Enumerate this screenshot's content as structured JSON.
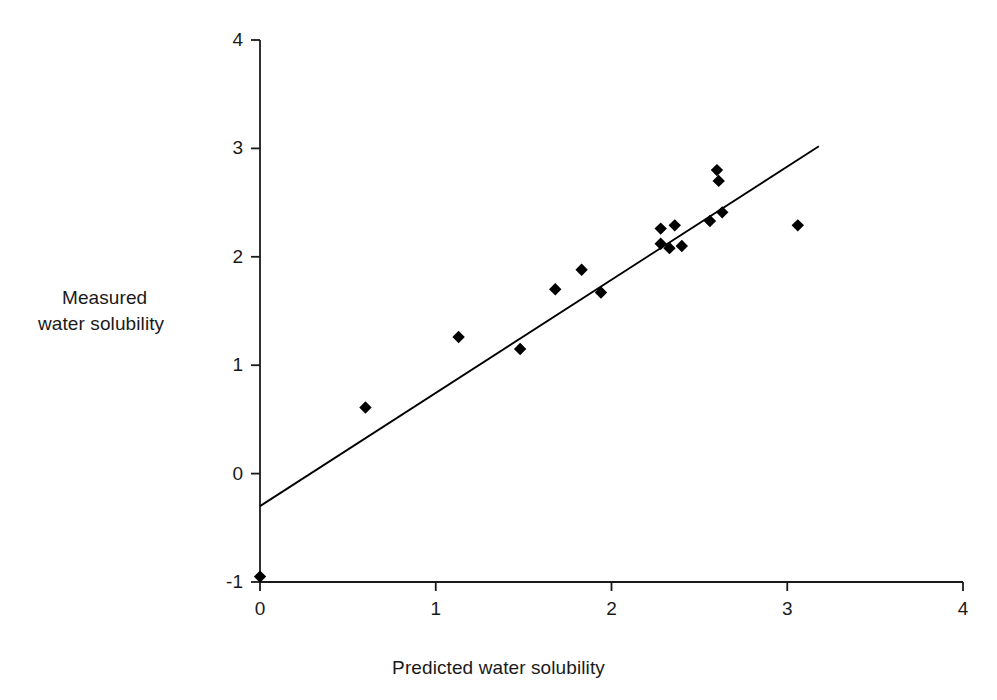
{
  "chart_data": {
    "type": "scatter",
    "title": "",
    "xlabel": "Predicted water solubility",
    "ylabel": "Measured\nwater solubility",
    "ylabel_lines": [
      "Measured",
      "water solubility"
    ],
    "xlim": [
      0,
      4
    ],
    "ylim": [
      -1,
      4
    ],
    "xticks": [
      0,
      1,
      2,
      3,
      4
    ],
    "yticks": [
      -1,
      0,
      1,
      2,
      3,
      4
    ],
    "xticklabels": [
      "0",
      "1",
      "2",
      "3",
      "4"
    ],
    "yticklabels": [
      "-1",
      "0",
      "1",
      "2",
      "3",
      "4"
    ],
    "grid": false,
    "legend": null,
    "marker": "diamond",
    "marker_color": "#000000",
    "line_color": "#000000",
    "points": [
      {
        "x": 0.0,
        "y": -0.95
      },
      {
        "x": 0.6,
        "y": 0.61
      },
      {
        "x": 1.13,
        "y": 1.26
      },
      {
        "x": 1.48,
        "y": 1.15
      },
      {
        "x": 1.68,
        "y": 1.7
      },
      {
        "x": 1.83,
        "y": 1.88
      },
      {
        "x": 1.94,
        "y": 1.67
      },
      {
        "x": 2.28,
        "y": 2.26
      },
      {
        "x": 2.28,
        "y": 2.12
      },
      {
        "x": 2.33,
        "y": 2.08
      },
      {
        "x": 2.36,
        "y": 2.29
      },
      {
        "x": 2.4,
        "y": 2.1
      },
      {
        "x": 2.56,
        "y": 2.33
      },
      {
        "x": 2.6,
        "y": 2.8
      },
      {
        "x": 2.61,
        "y": 2.7
      },
      {
        "x": 2.63,
        "y": 2.41
      },
      {
        "x": 3.06,
        "y": 2.29
      }
    ],
    "trendline": {
      "x_start": 0.0,
      "y_start": -0.3,
      "x_end": 3.18,
      "y_end": 3.02
    },
    "axes_pixel_geometry": {
      "x0_px": 260,
      "x4_px": 963,
      "ytop_px": 40,
      "ybottom_px": 582
    }
  }
}
